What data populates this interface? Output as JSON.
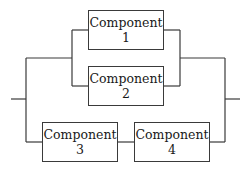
{
  "diagram": {
    "type": "reliability-block-diagram",
    "line_color": "#3a3a3a",
    "components": [
      {
        "id": 1,
        "name": "Component",
        "number": "1",
        "x": 88,
        "y": 10,
        "w": 76,
        "h": 40
      },
      {
        "id": 2,
        "name": "Component",
        "number": "2",
        "x": 88,
        "y": 66,
        "w": 76,
        "h": 40
      },
      {
        "id": 3,
        "name": "Component",
        "number": "3",
        "x": 42,
        "y": 122,
        "w": 76,
        "h": 40
      },
      {
        "id": 4,
        "name": "Component",
        "number": "4",
        "x": 134,
        "y": 122,
        "w": 76,
        "h": 40
      }
    ],
    "structure": "Input -> parallel[ parallel[Component 1, Component 2], series[Component 3, Component 4] ] -> Output"
  }
}
